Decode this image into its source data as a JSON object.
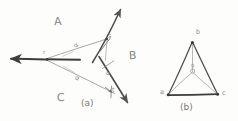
{
  "figure": {
    "kind": "hand-drawn-pencil-sketch",
    "caption_left": "(a)",
    "caption_right": "(b)",
    "region_labels": {
      "A": "A",
      "B": "B",
      "C": "C"
    },
    "diagram_a": {
      "origin_point_label": "r",
      "upper_point_label": "s",
      "lower_point_label": "t",
      "angle_label_upper": "α",
      "angle_label_lower": "α",
      "vectors": [
        {
          "name": "left-arrow",
          "from": "r",
          "direction": "west"
        },
        {
          "name": "up-right-arrow",
          "from": "r",
          "through": "s",
          "direction": "northeast"
        },
        {
          "name": "down-right-arrow",
          "from": "r",
          "through": "t",
          "direction": "southeast"
        },
        {
          "name": "cross-line-at-s",
          "direction": "northwest-southeast"
        },
        {
          "name": "cross-line-at-t",
          "direction": "northwest-southeast"
        }
      ]
    },
    "diagram_b": {
      "vertices": [
        {
          "label": "a",
          "position": "bottom-left"
        },
        {
          "label": "b",
          "position": "top"
        },
        {
          "label": "c",
          "position": "bottom-right"
        }
      ],
      "center_label": "o",
      "edges": [
        "a-b",
        "b-c",
        "a-c"
      ],
      "spokes": [
        "o-a",
        "o-b",
        "o-c"
      ]
    }
  },
  "colors": {
    "pencil_dark": "#4a4846",
    "pencil_mid": "#6f6d6b",
    "pencil_light": "#a3a19e",
    "paper": "#fdfdfc"
  }
}
